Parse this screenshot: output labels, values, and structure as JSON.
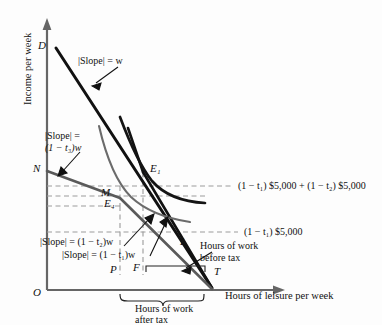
{
  "figure": {
    "axes": {
      "y_title": "Income per week",
      "x_title": "Hours of leisure per week",
      "origin_label": "O"
    },
    "points": [
      {
        "key": "D",
        "label": "D"
      },
      {
        "key": "N",
        "label": "N"
      },
      {
        "key": "M",
        "label": "M"
      },
      {
        "key": "E4",
        "label": "E₄"
      },
      {
        "key": "E1",
        "label": "E₁"
      },
      {
        "key": "L",
        "label": "L"
      },
      {
        "key": "P",
        "label": "P"
      },
      {
        "key": "F",
        "label": "F"
      },
      {
        "key": "T",
        "label": "T"
      }
    ],
    "slope_labels": [
      {
        "key": "w",
        "line1": "|Slope| = w",
        "line2": ""
      },
      {
        "key": "t3",
        "line1": "|Slope| =",
        "line2": "(1 − t₃)w"
      },
      {
        "key": "t2",
        "line1": "|Slope| = (1 − t₂)w",
        "line2": ""
      },
      {
        "key": "t1",
        "line1": "|Slope| = (1 − t₁)w",
        "line2": ""
      }
    ],
    "right_labels": [
      {
        "key": "income_two_brackets",
        "text": "(1 − t₁) $5,000 + (1 − t₂) $5,000"
      },
      {
        "key": "income_one_bracket",
        "text": "(1 − t₁) $5,000"
      }
    ],
    "brace_labels": [
      {
        "key": "before_tax",
        "line1": "Hours of work",
        "line2": "before tax"
      },
      {
        "key": "after_tax",
        "line1": "Hours of work",
        "line2": "after tax"
      }
    ],
    "colors": {
      "budget_line": "#111111",
      "indifference_curve": "#151515",
      "tax_line": "#4a4a4a",
      "dashed_guide": "#9a9a9a",
      "axis": "#555555",
      "text": "#111111"
    }
  }
}
